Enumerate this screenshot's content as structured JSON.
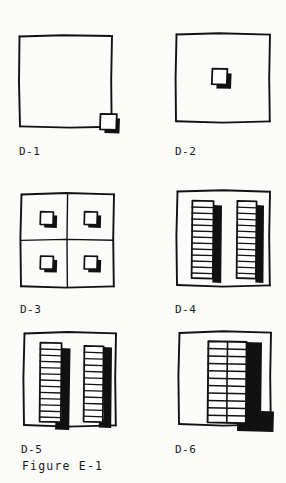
{
  "figure": {
    "caption": "Figure E-1",
    "background_color": "#fbfbfa",
    "ink_color": "#111111",
    "style": "hand-drawn line sketch, black ink on white",
    "columns": 2,
    "rows": 3
  },
  "panels": [
    {
      "id": "D-1",
      "label": "D-1",
      "description": "Empty site square with a single small shadowed block straddling the bottom-right corner",
      "frame": {
        "x": 19,
        "y": 35,
        "width": 93,
        "height": 92
      },
      "blocks": [
        {
          "name": "corner-block",
          "x": 100,
          "y": 114,
          "width": 17,
          "height": 17,
          "shadow": "right-bottom"
        }
      ],
      "grid_lines": 0,
      "block_count": 1
    },
    {
      "id": "D-2",
      "label": "D-2",
      "description": "Empty site square with a single small shadowed block at the center",
      "frame": {
        "x": 176,
        "y": 33,
        "width": 94,
        "height": 89
      },
      "blocks": [
        {
          "name": "center-block",
          "x": 212,
          "y": 69,
          "width": 16,
          "height": 17,
          "shadow": "right-bottom"
        }
      ],
      "grid_lines": 0,
      "block_count": 1
    },
    {
      "id": "D-3",
      "label": "D-3",
      "description": "Site square divided into a two-by-two grid with a small shadowed block in each quadrant",
      "frame": {
        "x": 21,
        "y": 193,
        "width": 93,
        "height": 93
      },
      "blocks": [
        {
          "name": "quadrant-block-top-left",
          "x": 40,
          "y": 212,
          "width": 15,
          "height": 16,
          "shadow": "right-bottom"
        },
        {
          "name": "quadrant-block-top-right",
          "x": 84,
          "y": 212,
          "width": 15,
          "height": 16,
          "shadow": "right-bottom"
        },
        {
          "name": "quadrant-block-bottom-left",
          "x": 40,
          "y": 256,
          "width": 15,
          "height": 16,
          "shadow": "right-bottom"
        },
        {
          "name": "quadrant-block-bottom-right",
          "x": 84,
          "y": 256,
          "width": 15,
          "height": 16,
          "shadow": "right-bottom"
        }
      ],
      "grid_lines": 2,
      "block_count": 4
    },
    {
      "id": "D-4",
      "label": "D-4",
      "description": "Site square with two tall narrow slab towers of stacked floors, each with a cast shadow to the right",
      "frame": {
        "x": 177,
        "y": 190,
        "width": 93,
        "height": 95
      },
      "towers": [
        {
          "name": "slab-tower-left",
          "x": 192,
          "y": 200,
          "width": 21,
          "height": 78,
          "floors": 13,
          "shadow_width": 9,
          "shadow_offset_y": 5
        },
        {
          "name": "slab-tower-right",
          "x": 237,
          "y": 200,
          "width": 19,
          "height": 78,
          "floors": 13,
          "shadow_width": 8,
          "shadow_offset_y": 5
        }
      ],
      "block_count": 2
    },
    {
      "id": "D-5",
      "label": "D-5",
      "description": "Site square with two taller slab towers of stacked floors with deeper black shadows spilling past the base",
      "frame": {
        "x": 24,
        "y": 332,
        "width": 92,
        "height": 93
      },
      "towers": [
        {
          "name": "slab-tower-left",
          "x": 41,
          "y": 342,
          "width": 21,
          "height": 80,
          "floors": 13,
          "shadow_width": 13,
          "shadow_offset_y": 6
        },
        {
          "name": "slab-tower-right",
          "x": 85,
          "y": 345,
          "width": 19,
          "height": 77,
          "floors": 12,
          "shadow_width": 11,
          "shadow_offset_y": 6
        }
      ],
      "block_count": 2
    },
    {
      "id": "D-6",
      "label": "D-6",
      "description": "Site square with one wide double-bay tower block of stacked floors and heavy black shadow to the right and below",
      "frame": {
        "x": 179,
        "y": 331,
        "width": 92,
        "height": 93
      },
      "towers": [
        {
          "name": "double-bay-tower",
          "x": 208,
          "y": 341,
          "width": 38,
          "height": 82,
          "floors": 11,
          "bays": 2,
          "shadow_width": 18,
          "shadow_offset_y": 5,
          "base_shadow": true
        }
      ],
      "block_count": 1
    }
  ]
}
